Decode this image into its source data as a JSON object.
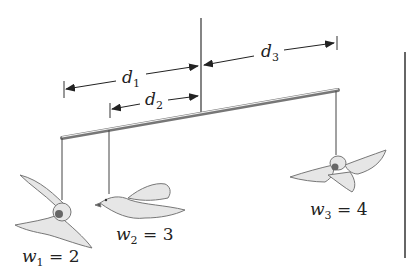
{
  "diagram": {
    "type": "mobile-balance",
    "colors": {
      "line": "#333333",
      "bird_fill": "#e6e6e6",
      "bird_stroke": "#777777",
      "rod": "#888888",
      "frame": "#555555"
    },
    "dimensions": [
      {
        "id": "d1",
        "symbol": "d",
        "subscript": "1"
      },
      {
        "id": "d2",
        "symbol": "d",
        "subscript": "2"
      },
      {
        "id": "d3",
        "symbol": "d",
        "subscript": "3"
      }
    ],
    "weights": [
      {
        "id": "w1",
        "symbol": "w",
        "subscript": "1",
        "eq": " = ",
        "value": "2"
      },
      {
        "id": "w2",
        "symbol": "w",
        "subscript": "2",
        "eq": " = ",
        "value": "3"
      },
      {
        "id": "w3",
        "symbol": "w",
        "subscript": "3",
        "eq": " = ",
        "value": "4"
      }
    ]
  }
}
